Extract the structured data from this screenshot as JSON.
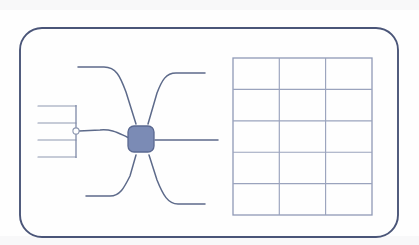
{
  "page": {
    "background_color": "#fdfdfd",
    "width": 419,
    "height": 245
  },
  "frame": {
    "name": "rounded-border-frame",
    "stroke_color": "#4a5578",
    "corner_radius": 22,
    "x": 20,
    "y": 28,
    "width": 378,
    "height": 209
  },
  "hub": {
    "label": "",
    "shape": "rounded-square",
    "fill_color": "#7b8bb5",
    "stroke_color": "#5a6890",
    "cx": 141,
    "cy": 139,
    "size": 26,
    "radius": 6
  },
  "junction": {
    "label": "",
    "shape": "circle",
    "fill_color": "#ffffff",
    "stroke_color": "#8d97b0",
    "cx": 76,
    "cy": 131,
    "r": 3.1
  },
  "branches": [
    {
      "id": "branch-upper-left",
      "label": "",
      "direction": "upper-left",
      "path": "M 78 67 L 104 67 C 116 67 120 76 126 92 L 136 124"
    },
    {
      "id": "branch-upper-right",
      "label": "",
      "direction": "upper-right",
      "path": "M 205 73 L 176 73 C 166 73 162 80 157 93 L 148 124"
    },
    {
      "id": "branch-right",
      "label": "",
      "direction": "right",
      "path": "M 155 140 L 218 140"
    },
    {
      "id": "branch-lower-left",
      "label": "",
      "direction": "lower-left",
      "path": "M 86 196 L 110 196 C 120 196 124 188 130 176 L 136 155"
    },
    {
      "id": "branch-lower-right",
      "label": "",
      "direction": "lower-right",
      "path": "M 205 204 L 178 204 C 168 204 163 195 157 180 L 149 155"
    },
    {
      "id": "branch-fan-stem",
      "label": "",
      "direction": "left",
      "path": "M 79 131 L 100 130 C 112 129 118 133 127 137 L 132 139"
    }
  ],
  "fan": {
    "name": "fan-in-bracket",
    "spine_x": 76,
    "spine_y_top": 106,
    "spine_y_bottom": 157,
    "line_start_x": 38,
    "lines": [
      {
        "id": "fan-line-1",
        "label": "",
        "y": 106
      },
      {
        "id": "fan-line-2",
        "label": "",
        "y": 123
      },
      {
        "id": "fan-line-3",
        "label": "",
        "y": 140
      },
      {
        "id": "fan-line-4",
        "label": "",
        "y": 157
      }
    ]
  },
  "grid": {
    "name": "empty-table-grid",
    "rows": 5,
    "columns": 3,
    "x": 233,
    "y": 58,
    "width": 139,
    "height": 157,
    "stroke_color": "#9aa3bd",
    "column_headers": [
      "",
      "",
      ""
    ],
    "cells": [
      [
        "",
        "",
        ""
      ],
      [
        "",
        "",
        ""
      ],
      [
        "",
        "",
        ""
      ],
      [
        "",
        "",
        ""
      ],
      [
        "",
        "",
        ""
      ]
    ]
  }
}
